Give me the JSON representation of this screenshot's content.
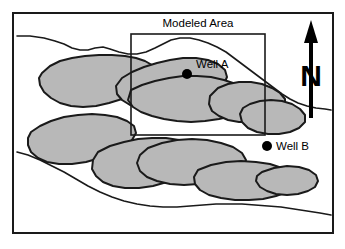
{
  "figure": {
    "type": "geologic-map",
    "background_color": "#ffffff",
    "frame": {
      "name": "map-frame",
      "x": 13,
      "y": 13,
      "width": 320,
      "height": 220,
      "stroke_color": "#1a1a1a",
      "stroke_width": 2
    },
    "colors": {
      "sand_body_fill": "#b8b8b8",
      "sand_body_outline": "#1a1a1a",
      "contour_line": "#1a1a1a",
      "text": "#000000",
      "well_marker": "#000000"
    },
    "labels": {
      "modeled_area": "Modeled Area",
      "well_a": "Well A",
      "well_b": "Well B",
      "north": "N"
    },
    "modeled_area_box": {
      "name": "modeled-area-box",
      "x": 131,
      "y": 34,
      "width": 134,
      "height": 101,
      "stroke_color": "#1a1a1a",
      "stroke_width": 1.6
    },
    "wells": [
      {
        "id": "well-a",
        "label": "Well A",
        "marker_x": 187,
        "marker_y": 74,
        "label_x": 196,
        "label_y": 68,
        "radius": 5
      },
      {
        "id": "well-b",
        "label": "Well B",
        "marker_x": 267,
        "marker_y": 146,
        "label_x": 276,
        "label_y": 150,
        "radius": 5
      }
    ],
    "north_arrow": {
      "name": "north-arrow",
      "letter": "N",
      "shaft_x": 311,
      "shaft_top": 30,
      "shaft_bottom": 118,
      "letter_x": 311,
      "letter_y": 86
    },
    "modeled_area_label": {
      "x": 198,
      "y": 27
    },
    "contours": [
      {
        "id": "contour-upper",
        "points": "17,36 30,36 44,38 55,41 64,44 72,48 80,50 88,50 95,48 103,47 110,49 119,52 128,54 137,54 146,52 155,48 163,44 171,40 180,38 190,38 199,40 208,43 217,47 226,52 234,58 242,64 250,70 258,76 266,82 274,88 282,94 290,99 298,103 307,106 316,108 325,109 331,110"
      },
      {
        "id": "contour-lower",
        "points": "17,152 28,155 40,160 52,166 64,172 76,179 88,186 100,192 112,197 124,201 137,204 150,206 163,207 177,207 190,206 203,205 216,204 229,204 242,204 255,205 268,206 281,207 294,209 307,211 320,213 331,215"
      }
    ],
    "sand_bodies": [
      {
        "id": "lobe-upper-left",
        "points": "42,73 50,66 60,61 72,58 85,56 99,55 112,55 125,56 136,58 145,61 152,65 157,70 157,77 152,83 144,89 134,94 122,99 109,103 96,106 83,107 71,106 60,103 51,98 44,92 40,85 39,78"
      },
      {
        "id": "lobe-upper-mid",
        "points": "122,78 132,72 144,67 157,63 170,60 183,58 196,58 208,60 218,64 225,70 227,77 224,84 217,90 207,96 195,101 182,105 168,108 154,109 141,108 130,105 122,100 117,94 116,86"
      },
      {
        "id": "lobe-mid-long",
        "points": "131,90 142,85 155,81 169,78 183,76 197,76 211,77 224,80 236,84 246,89 253,95 255,101 251,107 243,112 232,116 219,119 205,121 191,122 177,121 164,119 152,116 141,112 133,107 128,100"
      },
      {
        "id": "lobe-right-upper",
        "points": "218,88 228,84 239,82 251,82 262,84 272,88 280,93 285,99 285,106 280,112 272,117 262,120 251,122 239,122 228,120 219,116 212,111 209,104 210,96"
      },
      {
        "id": "lobe-right-tip",
        "points": "250,104 260,101 271,100 282,101 292,104 300,109 305,115 305,122 299,128 290,132 279,134 268,134 257,132 248,128 242,122 240,114 243,108"
      },
      {
        "id": "lobe-lower-left",
        "points": "31,132 40,126 51,121 64,117 78,115 92,114 105,115 117,117 127,121 134,126 136,133 132,140 124,147 113,153 100,158 86,162 72,164 59,164 47,162 38,158 31,152 28,145 28,138"
      },
      {
        "id": "lobe-lower-mid",
        "points": "98,152 110,146 124,142 138,139 152,138 166,138 179,140 190,144 198,150 201,157 198,164 191,171 180,177 167,182 153,186 139,188 125,188 113,186 103,182 96,176 92,169 93,160"
      },
      {
        "id": "lobe-lower-right-upper",
        "points": "148,148 162,143 177,140 192,139 207,140 221,143 233,147 242,153 246,160 243,167 236,173 225,178 212,182 198,184 184,185 170,184 157,181 147,177 140,171 137,163 140,155"
      },
      {
        "id": "lobe-lower-right",
        "points": "198,170 211,165 226,162 241,161 256,162 270,164 282,168 291,173 296,179 294,186 287,192 276,196 263,199 249,200 235,200 221,198 209,195 200,190 195,184 194,177"
      },
      {
        "id": "lobe-lower-far-right",
        "points": "262,172 274,168 287,166 299,167 309,170 316,175 318,181 315,187 308,191 298,194 287,195 276,194 267,191 260,187 256,181 257,176"
      }
    ]
  }
}
